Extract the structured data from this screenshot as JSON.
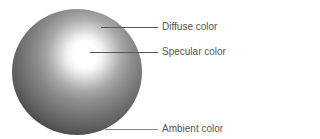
{
  "diagram": {
    "labels": {
      "diffuse": "Diffuse color",
      "specular": "Specular color",
      "ambient": "Ambient color"
    }
  }
}
